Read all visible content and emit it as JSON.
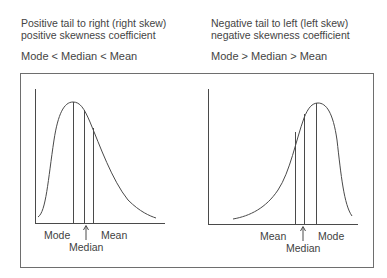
{
  "left_panel": {
    "title_line1": "Positive tail to right (right skew)",
    "title_line2": "positive skewness coefficient",
    "relation": "Mode < Median < Mean",
    "labels": {
      "mode": "Mode",
      "median": "Median",
      "mean": "Mean"
    }
  },
  "right_panel": {
    "title_line1": "Negative tail to left (left skew)",
    "title_line2": "negative skewness coefficient",
    "relation": "Mode > Median > Mean",
    "labels": {
      "mean": "Mean",
      "median": "Median",
      "mode": "Mode"
    }
  },
  "colors": {
    "line": "#4a4a4a",
    "border": "#6e6e6e",
    "text": "#444444"
  }
}
